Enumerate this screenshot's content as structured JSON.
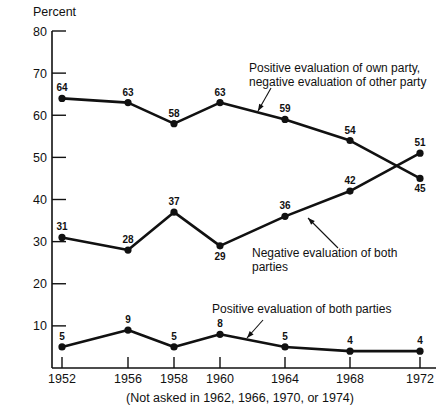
{
  "figure": {
    "axis_title": "Percent",
    "footnote": "(Not asked in 1962, 1966, 1970, or 1974)",
    "line_color": "#111111",
    "background_color": "#ffffff"
  },
  "annotations": [
    {
      "id": "annot-own-party",
      "line1": "Positive evaluation of own party,",
      "line2": "negative evaluation of other party",
      "text_x": 249,
      "text_y": 72,
      "leader": {
        "x1": 271,
        "y1": 88,
        "x2": 258,
        "y2": 111
      }
    },
    {
      "id": "annot-negative-both",
      "line1": "Negative evaluation of both",
      "line2": "parties",
      "text_x": 252,
      "text_y": 257,
      "leader": {
        "x1": 338,
        "y1": 248,
        "x2": 308,
        "y2": 218
      }
    },
    {
      "id": "annot-positive-both",
      "line1": "Positive evaluation of both parties",
      "line2": "",
      "text_x": 212,
      "text_y": 313,
      "leader": {
        "x1": 263,
        "y1": 320,
        "x2": 247,
        "y2": 338
      }
    }
  ],
  "chart_data": {
    "type": "line",
    "title": "",
    "subtitle": "",
    "xlabel": "",
    "ylabel": "Percent",
    "xlim": [
      1950.5,
      1973.5
    ],
    "ylim": [
      0,
      80
    ],
    "yticks": [
      10,
      20,
      30,
      40,
      50,
      60,
      70,
      80
    ],
    "grid": false,
    "legend": "inline-annotations",
    "categories": [
      "1952",
      "1956",
      "1958",
      "1960",
      "1964",
      "1968",
      "1972"
    ],
    "x": [
      1952,
      1956,
      1958,
      1960,
      1964,
      1968,
      1972
    ],
    "x_pixels": [
      62,
      128,
      174,
      220,
      285,
      350,
      420
    ],
    "series": [
      {
        "name": "Positive evaluation of own party, negative evaluation of other party",
        "values": [
          64,
          63,
          58,
          63,
          59,
          54,
          45
        ],
        "labels": [
          "64",
          "63",
          "58",
          "63",
          "59",
          "54",
          "45"
        ],
        "label_positions": [
          "above",
          "above",
          "above",
          "above",
          "above",
          "above",
          "below"
        ]
      },
      {
        "name": "Negative evaluation of both parties",
        "values": [
          31,
          28,
          37,
          29,
          36,
          42,
          51
        ],
        "labels": [
          "31",
          "28",
          "37",
          "29",
          "36",
          "42",
          "51"
        ],
        "label_positions": [
          "above",
          "above",
          "above",
          "below",
          "above",
          "above",
          "above"
        ]
      },
      {
        "name": "Positive evaluation of both parties",
        "values": [
          5,
          9,
          5,
          8,
          5,
          4,
          4
        ],
        "labels": [
          "5",
          "9",
          "5",
          "8",
          "5",
          "4",
          "4"
        ],
        "label_positions": [
          "above",
          "above",
          "above",
          "above",
          "above",
          "above",
          "above"
        ]
      }
    ]
  }
}
